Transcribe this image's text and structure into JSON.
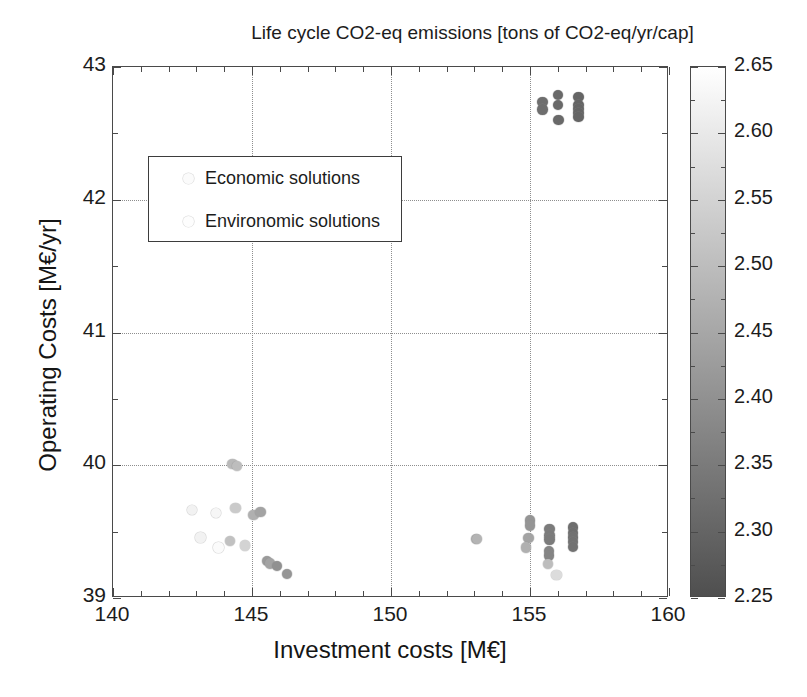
{
  "chart_data": {
    "type": "scatter",
    "title": "Life cycle CO2-eq emissions [tons of CO2-eq/yr/cap]",
    "xlabel": "Investment costs [M€]",
    "ylabel": "Operating Costs [M€/yr]",
    "xlim": [
      140,
      160
    ],
    "ylim": [
      39,
      43
    ],
    "xticks": [
      140,
      145,
      150,
      155,
      160
    ],
    "yticks": [
      39,
      40,
      41,
      42,
      43
    ],
    "xticklabels": [
      "140",
      "145",
      "150",
      "155",
      "160"
    ],
    "yticklabels": [
      "39",
      "40",
      "41",
      "42",
      "43"
    ],
    "x_minor_step": 1,
    "y_minor_step": 0.25,
    "grid": true,
    "grid_style": "dotted",
    "colormap": "grayscale-inverted",
    "colorbar": {
      "label": "Life cycle CO2-eq emissions [tons of CO2-eq/yr/cap]",
      "position": "right",
      "vmin": 2.25,
      "vmax": 2.65,
      "ticks": [
        2.25,
        2.3,
        2.35,
        2.4,
        2.45,
        2.5,
        2.55,
        2.6,
        2.65
      ],
      "ticklabels": [
        "2.25",
        "2.30",
        "2.35",
        "2.40",
        "2.45",
        "2.50",
        "2.55",
        "2.60",
        "2.65"
      ],
      "minor_step": 0.025,
      "top_color": "#ffffff",
      "bottom_color": "#4f4f4f"
    },
    "legend": {
      "position": "upper-left-inset",
      "entries": [
        {
          "label": "Economic solutions",
          "marker": "circle",
          "color": "#fbfbfb"
        },
        {
          "label": "Environomic solutions",
          "marker": "circle",
          "color": "#fdfdfd"
        }
      ]
    },
    "series": [
      {
        "name": "Economic solutions",
        "points": [
          {
            "x": 155.45,
            "y": 42.735,
            "c": 2.32
          },
          {
            "x": 155.45,
            "y": 42.68,
            "c": 2.32
          },
          {
            "x": 156.0,
            "y": 42.79,
            "c": 2.31
          },
          {
            "x": 156.0,
            "y": 42.715,
            "c": 2.31
          },
          {
            "x": 156.02,
            "y": 42.6,
            "c": 2.31
          },
          {
            "x": 156.75,
            "y": 42.775,
            "c": 2.3
          },
          {
            "x": 156.75,
            "y": 42.715,
            "c": 2.3
          },
          {
            "x": 156.75,
            "y": 42.685,
            "c": 2.3
          },
          {
            "x": 156.75,
            "y": 42.655,
            "c": 2.3
          },
          {
            "x": 156.75,
            "y": 42.625,
            "c": 2.3
          }
        ]
      },
      {
        "name": "Environomic solutions",
        "points": [
          {
            "x": 144.3,
            "y": 40.01,
            "c": 2.49
          },
          {
            "x": 144.45,
            "y": 39.995,
            "c": 2.5
          },
          {
            "x": 142.85,
            "y": 39.665,
            "c": 2.62
          },
          {
            "x": 143.7,
            "y": 39.64,
            "c": 2.63
          },
          {
            "x": 144.4,
            "y": 39.68,
            "c": 2.53
          },
          {
            "x": 145.05,
            "y": 39.625,
            "c": 2.47
          },
          {
            "x": 145.3,
            "y": 39.65,
            "c": 2.44
          },
          {
            "x": 143.15,
            "y": 39.455,
            "c": 2.62
          },
          {
            "x": 144.2,
            "y": 39.43,
            "c": 2.51
          },
          {
            "x": 143.8,
            "y": 39.38,
            "c": 2.64
          },
          {
            "x": 144.75,
            "y": 39.395,
            "c": 2.55
          },
          {
            "x": 145.55,
            "y": 39.28,
            "c": 2.42
          },
          {
            "x": 145.65,
            "y": 39.26,
            "c": 2.44
          },
          {
            "x": 145.9,
            "y": 39.24,
            "c": 2.4
          },
          {
            "x": 146.25,
            "y": 39.18,
            "c": 2.41
          },
          {
            "x": 153.05,
            "y": 39.445,
            "c": 2.47
          },
          {
            "x": 153.1,
            "y": 39.445,
            "c": 2.48
          },
          {
            "x": 154.95,
            "y": 39.45,
            "c": 2.44
          },
          {
            "x": 155.0,
            "y": 39.585,
            "c": 2.41
          },
          {
            "x": 155.0,
            "y": 39.545,
            "c": 2.41
          },
          {
            "x": 154.85,
            "y": 39.38,
            "c": 2.47
          },
          {
            "x": 155.7,
            "y": 39.52,
            "c": 2.35
          },
          {
            "x": 155.7,
            "y": 39.47,
            "c": 2.35
          },
          {
            "x": 155.7,
            "y": 39.44,
            "c": 2.35
          },
          {
            "x": 155.68,
            "y": 39.355,
            "c": 2.37
          },
          {
            "x": 155.68,
            "y": 39.32,
            "c": 2.37
          },
          {
            "x": 155.65,
            "y": 39.255,
            "c": 2.5
          },
          {
            "x": 155.95,
            "y": 39.175,
            "c": 2.57
          },
          {
            "x": 156.55,
            "y": 39.53,
            "c": 2.32
          },
          {
            "x": 156.55,
            "y": 39.49,
            "c": 2.32
          },
          {
            "x": 156.55,
            "y": 39.455,
            "c": 2.33
          },
          {
            "x": 156.55,
            "y": 39.42,
            "c": 2.33
          },
          {
            "x": 156.55,
            "y": 39.385,
            "c": 2.33
          }
        ]
      }
    ]
  }
}
